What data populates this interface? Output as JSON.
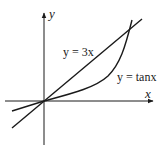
{
  "figure": {
    "axes": {
      "x_label": "x",
      "y_label": "y"
    },
    "curves": [
      {
        "id": "line",
        "label": "y = 3x"
      },
      {
        "id": "tan",
        "label": "y = tanx"
      }
    ],
    "colors": {
      "stroke": "#1a1a1a",
      "background": "#ffffff"
    }
  }
}
